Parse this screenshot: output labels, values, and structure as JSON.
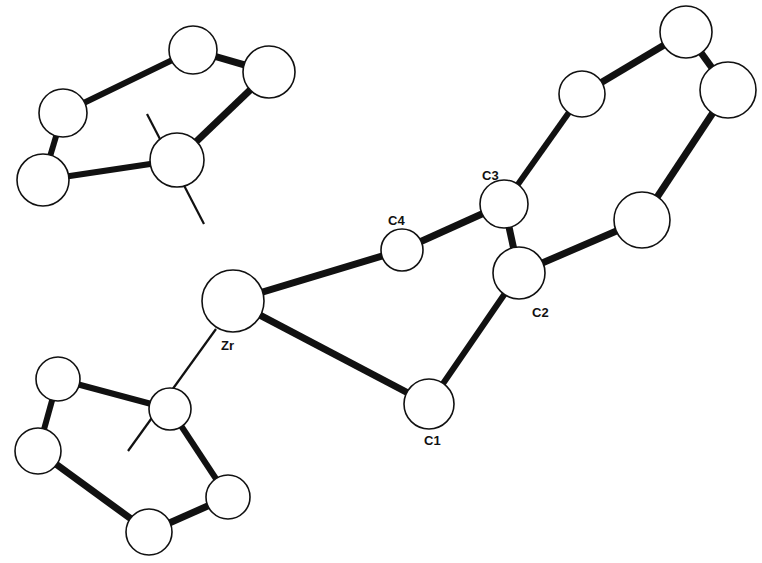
{
  "labels": {
    "zr": "Zr",
    "c1": "C1",
    "c2": "C2",
    "c3": "C3",
    "c4": "C4"
  },
  "atoms": [
    {
      "id": "cpA1",
      "x": 193,
      "y": 50,
      "r": 24
    },
    {
      "id": "cpA2",
      "x": 269,
      "y": 72,
      "r": 26
    },
    {
      "id": "cpA3",
      "x": 63,
      "y": 113,
      "r": 24
    },
    {
      "id": "cpA4",
      "x": 177,
      "y": 160,
      "r": 27
    },
    {
      "id": "cpA5",
      "x": 43,
      "y": 180,
      "r": 26
    },
    {
      "id": "Zr",
      "x": 233,
      "y": 301,
      "r": 31
    },
    {
      "id": "cpB1",
      "x": 58,
      "y": 379,
      "r": 22
    },
    {
      "id": "cpB2",
      "x": 170,
      "y": 409,
      "r": 21
    },
    {
      "id": "cpB3",
      "x": 38,
      "y": 451,
      "r": 23
    },
    {
      "id": "cpB4",
      "x": 228,
      "y": 497,
      "r": 22
    },
    {
      "id": "cpB5",
      "x": 149,
      "y": 532,
      "r": 23
    },
    {
      "id": "C1",
      "x": 429,
      "y": 404,
      "r": 25
    },
    {
      "id": "C2",
      "x": 519,
      "y": 273,
      "r": 26
    },
    {
      "id": "C3",
      "x": 504,
      "y": 204,
      "r": 24
    },
    {
      "id": "C4",
      "x": 402,
      "y": 250,
      "r": 21
    },
    {
      "id": "Ph1",
      "x": 582,
      "y": 94,
      "r": 23
    },
    {
      "id": "Ph2",
      "x": 686,
      "y": 32,
      "r": 26
    },
    {
      "id": "Ph3",
      "x": 728,
      "y": 90,
      "r": 28
    },
    {
      "id": "Ph4",
      "x": 642,
      "y": 220,
      "r": 28
    }
  ],
  "bonds": [
    {
      "a": "cpA1",
      "b": "cpA2",
      "w": 7
    },
    {
      "a": "cpA1",
      "b": "cpA3",
      "w": 6
    },
    {
      "a": "cpA3",
      "b": "cpA5",
      "w": 6
    },
    {
      "a": "cpA5",
      "b": "cpA4",
      "w": 6
    },
    {
      "a": "cpA4",
      "b": "cpA2",
      "w": 7
    },
    {
      "a": "cpB1",
      "b": "cpB2",
      "w": 6
    },
    {
      "a": "cpB1",
      "b": "cpB3",
      "w": 6
    },
    {
      "a": "cpB3",
      "b": "cpB5",
      "w": 7
    },
    {
      "a": "cpB5",
      "b": "cpB4",
      "w": 7
    },
    {
      "a": "cpB4",
      "b": "cpB2",
      "w": 6
    },
    {
      "a": "Zr",
      "b": "C4",
      "w": 7
    },
    {
      "a": "Zr",
      "b": "C1",
      "w": 7
    },
    {
      "a": "C4",
      "b": "C3",
      "w": 7
    },
    {
      "a": "C3",
      "b": "C2",
      "w": 7
    },
    {
      "a": "C2",
      "b": "C1",
      "w": 6
    },
    {
      "a": "C3",
      "b": "Ph1",
      "w": 6
    },
    {
      "a": "Ph1",
      "b": "Ph2",
      "w": 7
    },
    {
      "a": "Ph2",
      "b": "Ph3",
      "w": 7
    },
    {
      "a": "Ph3",
      "b": "Ph4",
      "w": 7
    },
    {
      "a": "Ph4",
      "b": "C2",
      "w": 7
    }
  ],
  "centroid_lines": [
    {
      "x1": 147,
      "y1": 114,
      "x2": 204,
      "y2": 224
    },
    {
      "x1": 128,
      "y1": 451,
      "x2": 216,
      "y2": 329
    }
  ]
}
